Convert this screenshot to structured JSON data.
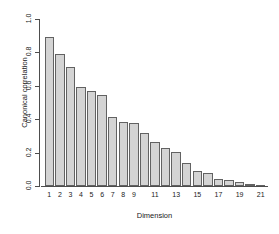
{
  "chart_data": {
    "type": "bar",
    "title": "",
    "subtitle": "",
    "xlabel": "Dimension",
    "ylabel": "Canonical correlation",
    "categories": [
      1,
      2,
      3,
      4,
      5,
      6,
      7,
      8,
      9,
      10,
      11,
      12,
      13,
      14,
      15,
      16,
      17,
      18,
      19,
      20,
      21
    ],
    "values": [
      0.89,
      0.79,
      0.71,
      0.595,
      0.57,
      0.545,
      0.415,
      0.385,
      0.38,
      0.315,
      0.265,
      0.225,
      0.205,
      0.135,
      0.09,
      0.075,
      0.04,
      0.035,
      0.025,
      0.01,
      0.002
    ],
    "xtick_labels": [
      "1",
      "2",
      "3",
      "4",
      "5",
      "6",
      "7",
      "8",
      "9",
      "",
      "11",
      "",
      "13",
      "",
      "15",
      "",
      "17",
      "",
      "19",
      "",
      "21"
    ],
    "ytick_labels": [
      "0.0",
      "0.2",
      "0.4",
      "0.6",
      "0.8",
      "1.0"
    ],
    "ytick_values": [
      0.0,
      0.2,
      0.4,
      0.6,
      0.8,
      1.0
    ],
    "ylim": [
      0.0,
      1.0
    ],
    "grid": false,
    "legend": "none",
    "bar_fill_color": "#d4d4d4",
    "bar_border_color": "#626262",
    "axis_color": "#4d4d4d",
    "background_color": "#ffffff"
  }
}
